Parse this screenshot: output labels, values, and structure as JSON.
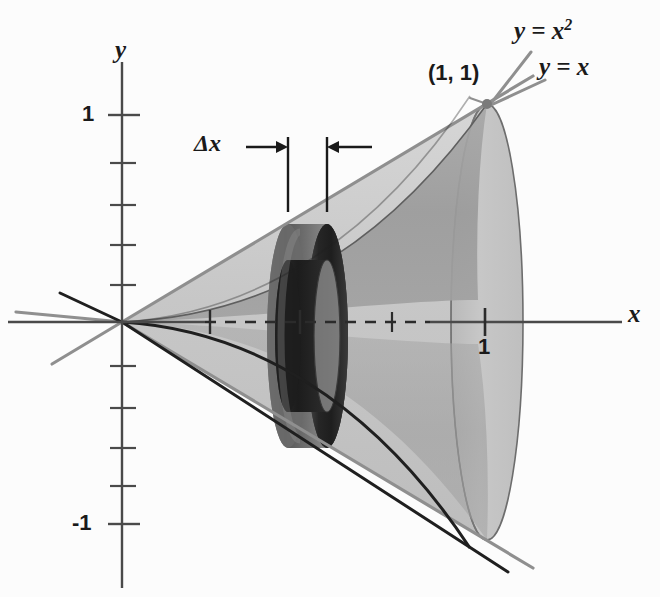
{
  "figure": {
    "background_color": "#fcfcfc"
  },
  "axes": {
    "x_label": "x",
    "y_label": "y",
    "x_tick_label_1": "1",
    "y_tick_label_pos1": "1",
    "y_tick_label_neg1": "-1",
    "axis_color": "#4a4a4a",
    "origin": {
      "x": 122,
      "y": 322
    },
    "x_unit_px": 363,
    "y_unit_px": 207,
    "x_ticks": [
      0.25,
      0.5,
      0.75,
      1.0
    ],
    "y_ticks": [
      1.0,
      0.75,
      0.5,
      0.25,
      -0.25,
      -0.5,
      -0.75,
      -1.0
    ]
  },
  "curves": {
    "parabola_label": "y = x",
    "parabola_exponent": "2",
    "line_label": "y = x",
    "line_color": "#8f8f8f",
    "parabola_color": "#2b2b2b",
    "intersection_point_label": "(1, 1)",
    "intersection_point": {
      "x": 1,
      "y": 1
    }
  },
  "washer": {
    "thickness_label": "Δx",
    "position_x": 0.46,
    "outer_radius_label": "y = x",
    "inner_radius_label": "y = x squared",
    "left_edge_px": 288,
    "right_edge_px": 327,
    "outer_fill": "#6e6e6e",
    "inner_fill": "#2a2a2a"
  },
  "surfaces": {
    "cone_fill": "#c9c9c9",
    "cone_fill_dark": "#b4b4b4",
    "paraboloid_fill": "#9a9a9a",
    "right_cap_fill": "#c2c2c2"
  },
  "annotations": {
    "dashed_axis_label": "axis of revolution",
    "arrow_color": "#1a1a1a"
  }
}
